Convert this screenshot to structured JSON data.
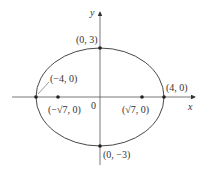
{
  "diagram": {
    "type": "ellipse",
    "equation_params": {
      "a": 4,
      "b": 3,
      "c": "sqrt(7)"
    },
    "axes": {
      "x_label": "x",
      "y_label": "y",
      "origin_label": "0"
    },
    "vertices": [
      {
        "name": "left-vertex",
        "label": "(−4, 0)"
      },
      {
        "name": "right-vertex",
        "label": "(4, 0)"
      },
      {
        "name": "top-covertex",
        "label": "(0, 3)"
      },
      {
        "name": "bottom-covertex",
        "label": "(0, −3)"
      }
    ],
    "foci": [
      {
        "name": "left-focus",
        "label": "(−√7, 0)"
      },
      {
        "name": "right-focus",
        "label": "(√7, 0)"
      }
    ],
    "colors": {
      "stroke": "#333333",
      "axis": "#555555"
    }
  }
}
